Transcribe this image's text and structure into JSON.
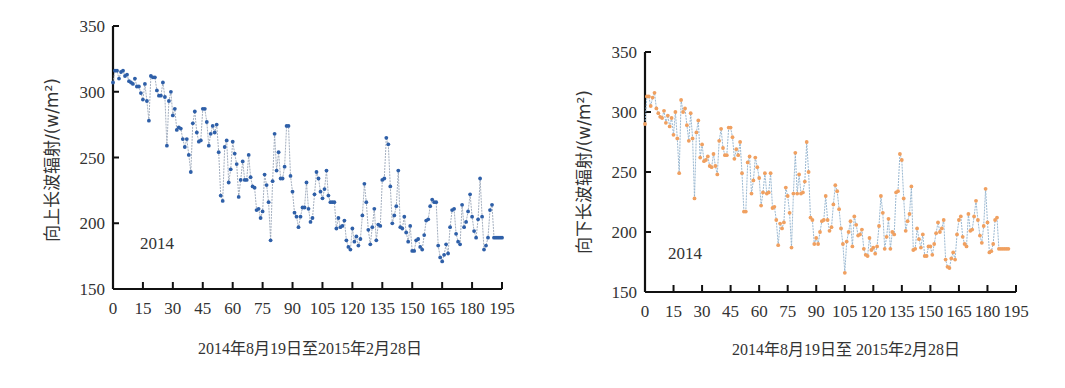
{
  "chart_data": [
    {
      "type": "line",
      "id": "left",
      "title": "",
      "ylabel": "向上长波辐射/(w/m²)",
      "xlabel": "2014年8月19日至2015年2月28日",
      "annotation": "2014",
      "ylim": [
        150,
        350
      ],
      "yticks": [
        150,
        200,
        250,
        300,
        350
      ],
      "xlim": [
        0,
        195
      ],
      "xticks": [
        0,
        15,
        30,
        45,
        60,
        75,
        90,
        105,
        120,
        135,
        150,
        165,
        180,
        195
      ],
      "grid": false,
      "legend": null,
      "marker_color": "#2e5fa8",
      "line_color": "#9aa6b8",
      "series": [
        {
          "name": "向上长波辐射",
          "values": [
            307,
            316,
            316,
            310,
            315,
            316,
            312,
            313,
            308,
            307,
            306,
            310,
            304,
            304,
            299,
            294,
            306,
            293,
            278,
            312,
            311,
            311,
            301,
            297,
            297,
            307,
            296,
            259,
            293,
            300,
            282,
            287,
            271,
            273,
            272,
            264,
            258,
            264,
            252,
            239,
            276,
            285,
            269,
            262,
            263,
            287,
            287,
            277,
            259,
            268,
            274,
            269,
            275,
            254,
            221,
            217,
            258,
            263,
            231,
            241,
            262,
            253,
            245,
            220,
            233,
            247,
            233,
            233,
            252,
            235,
            228,
            227,
            210,
            211,
            204,
            209,
            237,
            229,
            216,
            187,
            232,
            268,
            240,
            254,
            234,
            234,
            243,
            274,
            274,
            236,
            224,
            208,
            205,
            197,
            205,
            212,
            212,
            231,
            211,
            201,
            204,
            222,
            239,
            234,
            224,
            219,
            226,
            240,
            221,
            216,
            216,
            216,
            196,
            204,
            197,
            198,
            202,
            187,
            182,
            180,
            196,
            186,
            190,
            183,
            188,
            206,
            230,
            216,
            195,
            184,
            197,
            211,
            187,
            199,
            198,
            233,
            234,
            265,
            260,
            228,
            200,
            206,
            213,
            240,
            197,
            196,
            205,
            193,
            186,
            198,
            179,
            179,
            187,
            188,
            182,
            180,
            191,
            202,
            203,
            213,
            218,
            216,
            216,
            183,
            174,
            171,
            176,
            184,
            177,
            197,
            210,
            211,
            192,
            186,
            184,
            214,
            197,
            201,
            209,
            222,
            205,
            194,
            189,
            203,
            234,
            205,
            180,
            183,
            189,
            210,
            214,
            189,
            189,
            189,
            189,
            189
          ]
        }
      ]
    },
    {
      "type": "line",
      "id": "right",
      "title": "",
      "ylabel": "向下长波辐射/(w/m²)",
      "xlabel": "2014年8月19日至 2015年2月28日",
      "annotation": "2014",
      "ylim": [
        150,
        350
      ],
      "yticks": [
        150,
        200,
        250,
        300,
        350
      ],
      "xlim": [
        0,
        195
      ],
      "xticks": [
        0,
        15,
        30,
        45,
        60,
        75,
        90,
        105,
        120,
        135,
        150,
        165,
        180,
        195
      ],
      "grid": false,
      "legend": null,
      "marker_color": "#f0a060",
      "line_color": "#8fb0cc",
      "series": [
        {
          "name": "向下长波辐射",
          "values": [
            290,
            313,
            313,
            305,
            312,
            316,
            303,
            299,
            296,
            295,
            301,
            291,
            297,
            288,
            295,
            281,
            300,
            278,
            249,
            310,
            300,
            303,
            289,
            276,
            299,
            278,
            228,
            283,
            293,
            262,
            273,
            259,
            260,
            263,
            255,
            254,
            265,
            255,
            248,
            276,
            286,
            270,
            264,
            264,
            287,
            287,
            279,
            261,
            269,
            264,
            275,
            249,
            217,
            217,
            258,
            263,
            232,
            243,
            262,
            254,
            245,
            222,
            233,
            249,
            232,
            233,
            249,
            220,
            221,
            210,
            189,
            207,
            203,
            208,
            237,
            230,
            216,
            187,
            232,
            266,
            232,
            248,
            232,
            233,
            242,
            275,
            250,
            212,
            210,
            190,
            195,
            190,
            200,
            209,
            210,
            230,
            210,
            201,
            204,
            223,
            239,
            234,
            219,
            203,
            190,
            166,
            192,
            200,
            209,
            188,
            213,
            206,
            197,
            198,
            202,
            186,
            181,
            180,
            195,
            185,
            187,
            182,
            188,
            205,
            230,
            216,
            186,
            196,
            211,
            186,
            200,
            198,
            233,
            234,
            265,
            260,
            228,
            201,
            209,
            215,
            238,
            185,
            186,
            203,
            194,
            187,
            198,
            180,
            180,
            188,
            188,
            181,
            190,
            199,
            208,
            200,
            203,
            210,
            177,
            171,
            170,
            178,
            183,
            177,
            198,
            210,
            213,
            196,
            190,
            188,
            215,
            201,
            202,
            213,
            226,
            210,
            197,
            191,
            205,
            236,
            208,
            183,
            184,
            190,
            210,
            212,
            186,
            186,
            186,
            186,
            186,
            186
          ]
        }
      ]
    }
  ]
}
